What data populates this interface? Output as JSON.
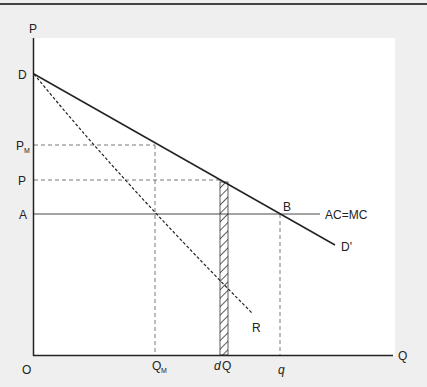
{
  "diagram": {
    "axes": {
      "y_label": "P",
      "x_label": "Q",
      "origin_label": "O"
    },
    "y_ticks": [
      {
        "id": "D",
        "label": "D",
        "sub": ""
      },
      {
        "id": "PM",
        "label": "P",
        "sub": "M"
      },
      {
        "id": "P",
        "label": "P",
        "sub": ""
      },
      {
        "id": "A",
        "label": "A",
        "sub": ""
      }
    ],
    "x_ticks": [
      {
        "id": "QM",
        "label": "Q",
        "sub": "M"
      },
      {
        "id": "dQ",
        "label_italic": "d",
        "label": "Q"
      },
      {
        "id": "q",
        "label": "q"
      }
    ],
    "curves": {
      "demand": {
        "label": "D'",
        "style": "solid"
      },
      "marginal_revenue": {
        "label": "R",
        "style": "dashed"
      },
      "cost": {
        "label": "AC=MC",
        "style": "solid-thin"
      }
    },
    "points": {
      "B": "B"
    },
    "strip": {
      "name": "dQ strip",
      "style": "hatched"
    }
  }
}
